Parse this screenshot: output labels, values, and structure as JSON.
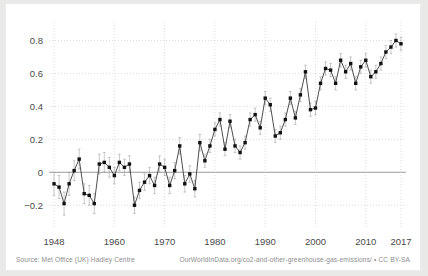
{
  "footer": {
    "source": "Source: Met Office (UK) Hadley Centre",
    "attribution": "OurWorldInData.org/co2-and-other-greenhouse-gas-emissions/ • CC BY-SA"
  },
  "colors": {
    "marker": "#111111",
    "line": "#3a3a3a",
    "grid": "#cfcfcf",
    "zero_axis": "#9a9a9a",
    "tick_text": "#4a4a4a",
    "footer_text": "#8d8d8d",
    "card_background": "#ffffff",
    "page_background": "#e9e9e7"
  },
  "chart_data": {
    "type": "line",
    "title": "",
    "xlabel": "",
    "ylabel": "",
    "xlim": [
      1947,
      2018
    ],
    "ylim": [
      -0.32,
      0.9
    ],
    "grid": true,
    "legend": "none",
    "markers": "square",
    "error_bars": "vertical whiskers",
    "xticks": [
      1948,
      1960,
      1970,
      1980,
      1990,
      2000,
      2010,
      2017
    ],
    "xticklabels": [
      "1948",
      "1960",
      "1970",
      "1980",
      "1990",
      "2000",
      "2010",
      "2017"
    ],
    "yticks": [
      -0.2,
      0,
      0.2,
      0.4,
      0.6,
      0.8
    ],
    "yticklabels": [
      "−0.2",
      "0",
      "0.2",
      "0.4",
      "0.6",
      "0.8"
    ],
    "x": [
      1948,
      1949,
      1950,
      1951,
      1952,
      1953,
      1954,
      1955,
      1956,
      1957,
      1958,
      1959,
      1960,
      1961,
      1962,
      1963,
      1964,
      1965,
      1966,
      1967,
      1968,
      1969,
      1970,
      1971,
      1972,
      1973,
      1974,
      1975,
      1976,
      1977,
      1978,
      1979,
      1980,
      1981,
      1982,
      1983,
      1984,
      1985,
      1986,
      1987,
      1988,
      1989,
      1990,
      1991,
      1992,
      1993,
      1994,
      1995,
      1996,
      1997,
      1998,
      1999,
      2000,
      2001,
      2002,
      2003,
      2004,
      2005,
      2006,
      2007,
      2008,
      2009,
      2010,
      2011,
      2012,
      2013,
      2014,
      2015,
      2016,
      2017
    ],
    "values": [
      -0.07,
      -0.09,
      -0.19,
      -0.07,
      0.01,
      0.08,
      -0.13,
      -0.14,
      -0.19,
      0.05,
      0.06,
      0.03,
      -0.02,
      0.06,
      0.03,
      0.05,
      -0.2,
      -0.11,
      -0.06,
      -0.02,
      -0.08,
      0.05,
      0.03,
      -0.08,
      0.01,
      0.16,
      -0.07,
      -0.01,
      -0.1,
      0.18,
      0.07,
      0.16,
      0.26,
      0.32,
      0.14,
      0.31,
      0.16,
      0.12,
      0.18,
      0.32,
      0.35,
      0.27,
      0.45,
      0.41,
      0.22,
      0.24,
      0.32,
      0.45,
      0.33,
      0.47,
      0.61,
      0.38,
      0.39,
      0.54,
      0.63,
      0.62,
      0.54,
      0.68,
      0.61,
      0.66,
      0.54,
      0.64,
      0.68,
      0.58,
      0.61,
      0.66,
      0.73,
      0.76,
      0.8,
      0.78
    ],
    "uncertainty": [
      0.07,
      0.07,
      0.07,
      0.07,
      0.06,
      0.06,
      0.06,
      0.06,
      0.06,
      0.06,
      0.06,
      0.06,
      0.05,
      0.05,
      0.05,
      0.05,
      0.05,
      0.05,
      0.05,
      0.05,
      0.05,
      0.05,
      0.05,
      0.05,
      0.05,
      0.05,
      0.05,
      0.05,
      0.05,
      0.05,
      0.04,
      0.04,
      0.04,
      0.04,
      0.04,
      0.04,
      0.04,
      0.04,
      0.04,
      0.04,
      0.04,
      0.04,
      0.04,
      0.04,
      0.04,
      0.04,
      0.04,
      0.04,
      0.04,
      0.04,
      0.04,
      0.04,
      0.04,
      0.04,
      0.04,
      0.04,
      0.04,
      0.04,
      0.04,
      0.04,
      0.04,
      0.04,
      0.04,
      0.04,
      0.04,
      0.04,
      0.04,
      0.04,
      0.04,
      0.04
    ]
  }
}
